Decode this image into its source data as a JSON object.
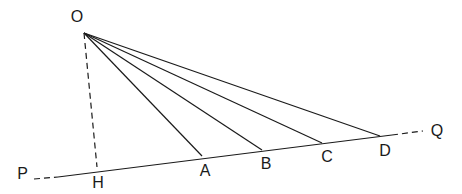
{
  "diagram": {
    "title": "",
    "colors": {
      "stroke": "#1a1a1a",
      "background": "#ffffff"
    },
    "points": {
      "O": {
        "label": "O",
        "x": 84,
        "y": 33,
        "lx": 77,
        "ly": 22
      },
      "H": {
        "label": "H",
        "x": 97,
        "y": 167,
        "lx": 98,
        "ly": 188
      },
      "A": {
        "label": "A",
        "x": 202,
        "y": 156,
        "lx": 205,
        "ly": 176
      },
      "B": {
        "label": "B",
        "x": 262,
        "y": 150,
        "lx": 266,
        "ly": 169
      },
      "C": {
        "label": "C",
        "x": 322,
        "y": 143,
        "lx": 327,
        "ly": 162
      },
      "D": {
        "label": "D",
        "x": 380,
        "y": 136,
        "lx": 385,
        "ly": 156
      },
      "P": {
        "label": "P",
        "x": 34,
        "y": 179,
        "lx": 28,
        "ly": 179
      },
      "Q": {
        "label": "Q",
        "x": 423,
        "y": 131,
        "lx": 437,
        "ly": 136
      }
    },
    "segments": [
      {
        "from": "O",
        "to": "H",
        "style": "dashed",
        "name": "perpendicular-OH"
      },
      {
        "from": "O",
        "to": "A",
        "style": "solid",
        "name": "segment-OA"
      },
      {
        "from": "O",
        "to": "B",
        "style": "solid",
        "name": "segment-OB"
      },
      {
        "from": "O",
        "to": "C",
        "style": "solid",
        "name": "segment-OC"
      },
      {
        "from": "O",
        "to": "D",
        "style": "solid",
        "name": "segment-OD"
      }
    ],
    "line_PQ": {
      "name": "line-PQ",
      "dashed_left": {
        "x1": 34,
        "y1": 179,
        "x2": 58,
        "y2": 177
      },
      "solid": {
        "x1": 58,
        "y1": 177,
        "x2": 392,
        "y2": 135
      },
      "dashed_right": {
        "x1": 392,
        "y1": 135,
        "x2": 423,
        "y2": 131
      }
    }
  }
}
